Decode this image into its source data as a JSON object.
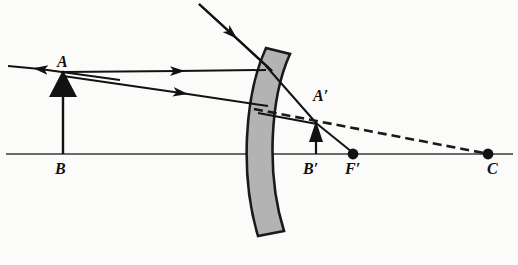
{
  "figure": {
    "type": "ray-diagram",
    "canvas": {
      "width": 518,
      "height": 265
    },
    "colors": {
      "background": "#fbfbfa",
      "ink": "#121212",
      "mirror_fill": "#b3b3b3",
      "mirror_stroke": "#1a1a1a",
      "axis": "#3a3a3a",
      "dashed": "#1a1a1a"
    },
    "labels": [
      {
        "id": "A",
        "text": "A",
        "x": 57,
        "y": 54,
        "meaning": "object-tip"
      },
      {
        "id": "B",
        "text": "B",
        "x": 55,
        "y": 161,
        "meaning": "object-base-on-axis"
      },
      {
        "id": "Ap",
        "text": "A′",
        "x": 313,
        "y": 88,
        "meaning": "image-tip"
      },
      {
        "id": "Bp",
        "text": "B′",
        "x": 303,
        "y": 161,
        "meaning": "image-base-on-axis"
      },
      {
        "id": "Fp",
        "text": "F′",
        "x": 345,
        "y": 161,
        "meaning": "focal-point"
      },
      {
        "id": "C",
        "text": "C",
        "x": 487,
        "y": 161,
        "meaning": "center-of-curvature"
      }
    ],
    "axis": {
      "y": 154,
      "x_start": 6,
      "x_end": 513
    },
    "object_arrow": {
      "x": 63,
      "base_y": 154,
      "tip_y": 72
    },
    "image_arrow": {
      "x": 316,
      "base_y": 154,
      "tip_y": 122
    },
    "points_on_axis": [
      {
        "id": "F-prime",
        "x": 353,
        "y": 154,
        "radius": 5.2
      },
      {
        "id": "C",
        "x": 488,
        "y": 154,
        "radius": 5.2
      }
    ],
    "mirror": {
      "shape": "curved-band",
      "top_x": 272,
      "top_y": 48,
      "bottom_x": 272,
      "bottom_y": 236,
      "thickness": 15,
      "bulge": "left-concave-toward-object"
    },
    "rays": [
      {
        "id": "incident-oblique",
        "from": [
          199,
          4
        ],
        "to": [
          272,
          70
        ],
        "arrow_at": [
          232,
          42
        ],
        "style": "solid"
      },
      {
        "id": "ray-A-parallel",
        "from": [
          63,
          72
        ],
        "to": [
          266,
          70
        ],
        "arrow_at": [
          178,
          71
        ],
        "style": "solid"
      },
      {
        "id": "ray-A-oblique",
        "from": [
          63,
          76
        ],
        "to": [
          268,
          106
        ],
        "arrow_at": [
          181,
          93
        ],
        "style": "solid"
      },
      {
        "id": "reflected-to-left",
        "from": [
          63,
          73
        ],
        "to": [
          8,
          66
        ],
        "arrow_at": [
          16,
          67
        ],
        "style": "solid"
      },
      {
        "id": "reflected-upper-to-image",
        "from": [
          266,
          70
        ],
        "to": [
          316,
          123
        ],
        "style": "solid"
      },
      {
        "id": "reflected-lower-to-image",
        "from": [
          262,
          114
        ],
        "to": [
          316,
          123
        ],
        "style": "solid"
      },
      {
        "id": "image-to-focal",
        "from": [
          316,
          123
        ],
        "to": [
          353,
          153
        ],
        "style": "solid"
      },
      {
        "id": "chief-ray-dashed",
        "from": [
          257,
          110
        ],
        "to": [
          488,
          154
        ],
        "style": "dashed"
      }
    ]
  }
}
